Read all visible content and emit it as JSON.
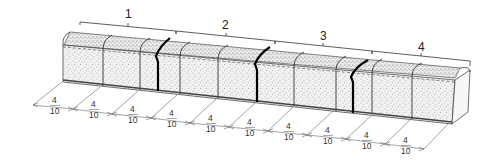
{
  "figure": {
    "colors": {
      "line": "#222222",
      "stipple": "#555555",
      "crack": "#000000",
      "dimension": "#555555"
    }
  },
  "groups": [
    {
      "label": "1"
    },
    {
      "label": "2"
    },
    {
      "label": "3"
    },
    {
      "label": "4"
    }
  ],
  "dimensions": [
    {
      "numerator": "4",
      "denominator": "10"
    },
    {
      "numerator": "4",
      "denominator": "10"
    },
    {
      "numerator": "4",
      "denominator": "10"
    },
    {
      "numerator": "4",
      "denominator": "10"
    },
    {
      "numerator": "4",
      "denominator": "10"
    },
    {
      "numerator": "4",
      "denominator": "10"
    },
    {
      "numerator": "4",
      "denominator": "10"
    },
    {
      "numerator": "4",
      "denominator": "10"
    },
    {
      "numerator": "4",
      "denominator": "10"
    },
    {
      "numerator": "4",
      "denominator": "10"
    }
  ]
}
